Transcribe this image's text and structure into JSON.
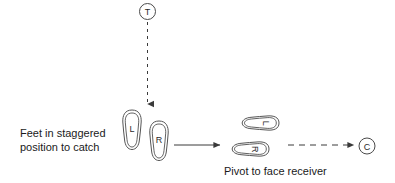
{
  "diagram": {
    "background_color": "#ffffff",
    "line_color": "#3a3a3a",
    "text_color": "#1a1a1a",
    "markers": [
      {
        "id": "thrower",
        "letter": "T",
        "cx": 147.5,
        "cy": 11.5,
        "r": 8.0
      },
      {
        "id": "receiver",
        "letter": "C",
        "cx": 367.0,
        "cy": 146.0,
        "r": 8.0
      }
    ],
    "feet": [
      {
        "id": "left-foot-start",
        "letter": "L",
        "orientation": "vertical",
        "cx": 132.0,
        "cy": 130.0
      },
      {
        "id": "right-foot-start",
        "letter": "R",
        "orientation": "vertical",
        "cx": 159.0,
        "cy": 141.0
      },
      {
        "id": "left-foot-pivot",
        "letter": "L",
        "orientation": "horizontal",
        "cx": 259.0,
        "cy": 123.0
      },
      {
        "id": "right-foot-pivot",
        "letter": "R",
        "orientation": "horizontal",
        "cx": 249.0,
        "cy": 149.0
      }
    ],
    "arrows": [
      {
        "id": "pass-arrow",
        "style": "dashed",
        "direction": "down",
        "from_x": 147.5,
        "from_y": 22.0,
        "to_x": 147.5,
        "to_y": 106.0
      },
      {
        "id": "pivot-arrow",
        "style": "solid",
        "direction": "right",
        "from_x": 174.0,
        "from_y": 145.0,
        "to_x": 222.0,
        "to_y": 145.0
      },
      {
        "id": "throw-arrow",
        "style": "dashed",
        "direction": "right",
        "from_x": 288.0,
        "from_y": 145.0,
        "to_x": 356.0,
        "to_y": 145.0
      }
    ],
    "labels": {
      "staggered_line1": "Feet in staggered",
      "staggered_line2": "position to catch",
      "pivot": "Pivot to face receiver"
    }
  }
}
